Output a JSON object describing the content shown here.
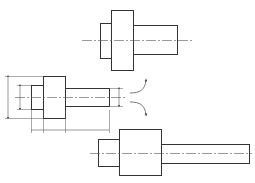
{
  "diagram": {
    "title": "",
    "type": "technical-drawing-stepped-shafts",
    "colors": {
      "stroke": "#333333",
      "centerline": "#555555",
      "dimension": "#555555",
      "background": "#ffffff"
    },
    "shafts": [
      {
        "id": "top-shaft",
        "centerline": {
          "x1": 82,
          "x2": 193,
          "y": 40
        },
        "segments": [
          {
            "name": "small-end",
            "x": 100,
            "y": 23,
            "w": 11,
            "h": 35
          },
          {
            "name": "collar",
            "x": 111,
            "y": 10,
            "w": 22,
            "h": 60
          },
          {
            "name": "shaft",
            "x": 133,
            "y": 25,
            "w": 44,
            "h": 29
          }
        ]
      },
      {
        "id": "middle-shaft",
        "centerline": {
          "x1": 15,
          "x2": 125,
          "y": 97
        },
        "segments": [
          {
            "name": "small-end",
            "x": 31,
            "y": 85,
            "w": 12,
            "h": 24
          },
          {
            "name": "collar",
            "x": 43,
            "y": 76,
            "w": 22,
            "h": 42
          },
          {
            "name": "shaft",
            "x": 65,
            "y": 88,
            "w": 44,
            "h": 18
          }
        ]
      },
      {
        "id": "bottom-shaft",
        "centerline": {
          "x1": 90,
          "x2": 252,
          "y": 153
        },
        "segments": [
          {
            "name": "small-end",
            "x": 98,
            "y": 139,
            "w": 21,
            "h": 27
          },
          {
            "name": "collar",
            "x": 119,
            "y": 129,
            "w": 42,
            "h": 46
          },
          {
            "name": "shaft",
            "x": 161,
            "y": 144,
            "w": 88,
            "h": 19
          }
        ]
      }
    ],
    "dimensions": {
      "vertical": [
        {
          "name": "collar-diameter",
          "x": 8,
          "y1": 76,
          "y2": 118
        },
        {
          "name": "small-end-diameter",
          "x": 20,
          "y1": 85,
          "y2": 109
        },
        {
          "name": "shaft-diameter",
          "x": 119,
          "y1": 88,
          "y2": 106
        }
      ],
      "horizontal_y": 130,
      "horizontal_ticks": [
        31,
        43,
        65,
        109
      ]
    },
    "arrows": [
      {
        "name": "arrow-up",
        "direction": "up"
      },
      {
        "name": "arrow-down",
        "direction": "down"
      }
    ]
  }
}
